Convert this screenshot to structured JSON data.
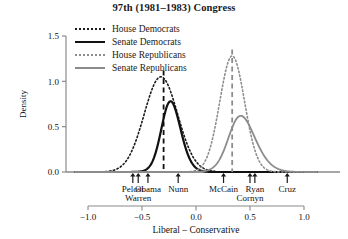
{
  "chart_data": {
    "type": "line",
    "title": "97th (1981–1983) Congress",
    "xlabel": "Liberal – Conservative",
    "ylabel": "Density",
    "xlim": [
      -1.12,
      1.12
    ],
    "ylim": [
      0,
      1.5
    ],
    "xticks": [
      -1.0,
      -0.5,
      0.0,
      0.5,
      1.0
    ],
    "xticklabels": [
      "−1.0",
      "−0.5",
      "0.0",
      "0.5",
      "1.0"
    ],
    "yticks": [
      0.0,
      0.5,
      1.0,
      1.5
    ],
    "yticklabels": [
      "0.0",
      "0.5",
      "1.0",
      "1.5"
    ],
    "grid": false,
    "legend_position": "top-left",
    "series": [
      {
        "name": "House Democrats",
        "style": "dotted",
        "color": "#1a1a1a",
        "width": 1.6,
        "mean": -0.325,
        "sd": 0.155,
        "peak": 1.05,
        "skew": 0.0
      },
      {
        "name": "Senate Democrats",
        "style": "solid",
        "color": "#111111",
        "width": 2.2,
        "mean": -0.295,
        "sd": 0.115,
        "peak": 0.78,
        "skew": 1.1
      },
      {
        "name": "House Republicans",
        "style": "dotted",
        "color": "#8c8c8c",
        "width": 1.6,
        "mean": 0.335,
        "sd": 0.115,
        "peak": 1.28,
        "skew": 0.0
      },
      {
        "name": "Senate Republicans",
        "style": "solid",
        "color": "#8c8c8c",
        "width": 1.8,
        "mean": 0.325,
        "sd": 0.17,
        "peak": 0.62,
        "skew": 1.4
      }
    ],
    "vlines": [
      {
        "name": "democrat-mean",
        "x": -0.3,
        "color": "#111111",
        "style": "dashed",
        "top": 1.12
      },
      {
        "name": "republican-mean",
        "x": 0.335,
        "color": "#8c8c8c",
        "style": "dashed",
        "top": 1.35
      }
    ],
    "annotations": [
      {
        "label": "Pelosi",
        "x": -0.585,
        "row": 0
      },
      {
        "label": "Warren",
        "x": -0.535,
        "row": 1
      },
      {
        "label": "Obama",
        "x": -0.445,
        "row": 0
      },
      {
        "label": "Nunn",
        "x": -0.165,
        "row": 0
      },
      {
        "label": "McCain",
        "x": 0.255,
        "row": 0
      },
      {
        "label": "Cornyn",
        "x": 0.5,
        "row": 1
      },
      {
        "label": "Ryan",
        "x": 0.545,
        "row": 0
      },
      {
        "label": "Cruz",
        "x": 0.845,
        "row": 0
      }
    ]
  },
  "legend": {
    "items": [
      {
        "label": "House Democrats"
      },
      {
        "label": "Senate Democrats"
      },
      {
        "label": "House Republicans"
      },
      {
        "label": "Senate Republicans"
      }
    ]
  }
}
